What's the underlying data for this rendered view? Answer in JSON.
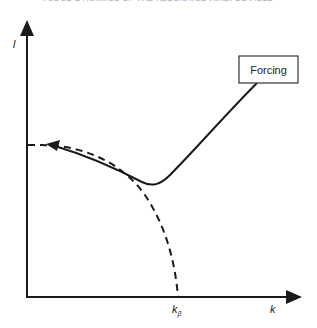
{
  "page": {
    "header": "FLOOD DYNAMICS OF THE RESONATED AIRSPEC FIELD"
  },
  "diagram": {
    "y_axis_label": "l",
    "x_axis_label": "k",
    "x_marker_label": "k",
    "x_marker_subscript": "β",
    "forcing_label": "Forcing",
    "curves": [
      {
        "name": "forced-response",
        "style": "solid",
        "description": "curve from forcing box descending to a minimum then rising, with arrow toward l-axis"
      },
      {
        "name": "free-mode",
        "style": "dashed",
        "description": "quarter-circle-like curve from l-axis intercept down to k_beta on k-axis"
      }
    ]
  }
}
